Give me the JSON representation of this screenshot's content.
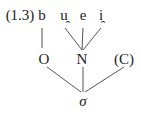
{
  "example_label": "(1.3)",
  "segments": [
    {
      "text": "b",
      "x": 42
    },
    {
      "text": "u̯",
      "x": 63
    },
    {
      "text": "e",
      "x": 83
    },
    {
      "text": "i̯",
      "x": 101
    }
  ],
  "constituents": {
    "onset": "O",
    "nucleus": "N",
    "coda": "(C)"
  },
  "root": "σ"
}
